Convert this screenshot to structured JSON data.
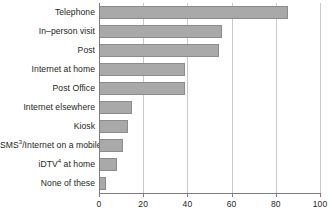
{
  "chart_data": {
    "type": "bar",
    "orientation": "horizontal",
    "title": "",
    "xlabel": "",
    "ylabel": "",
    "xlim": [
      0,
      100
    ],
    "xticks": [
      0,
      20,
      40,
      60,
      80,
      100
    ],
    "xtick_labels": [
      "0",
      "20",
      "40",
      "60",
      "80",
      "100"
    ],
    "grid": true,
    "grid_axis": "x",
    "legend": false,
    "bar_color": "#a9a9a9",
    "bar_edge_color": "#8c8c8c",
    "axis_color": "#7d7d7d",
    "grid_color": "#c9c9c9",
    "text_color": "#231f20",
    "categories": [
      "Telephone",
      "In–person visit",
      "Post",
      "Internet at home",
      "Post Office",
      "Internet elsewhere",
      "Kiosk",
      "SMS3/Internet on a mobile",
      "iDTV4 at home",
      "None of these"
    ],
    "category_labels_html": [
      "Telephone",
      "In–person visit",
      "Post",
      "Internet at home",
      "Post Office",
      "Internet elsewhere",
      "Kiosk",
      "SMS<sup>3</sup>/Internet on a mobile",
      "iDTV<sup>4</sup> at home",
      "None of these"
    ],
    "values": [
      85.5,
      55.5,
      54.5,
      39,
      39,
      15,
      13,
      11,
      8,
      3
    ]
  }
}
